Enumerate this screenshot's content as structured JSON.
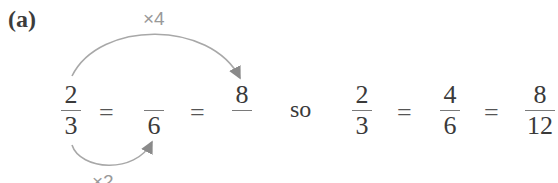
{
  "label": "(a)",
  "arrows": {
    "top": {
      "operator": "×4",
      "from": "numerator 2",
      "to": "numerator 8"
    },
    "bottom": {
      "operator": "×2",
      "from": "denominator 3",
      "to": "denominator 6"
    },
    "color": "#9a9a9a"
  },
  "left_equation": {
    "fractions": [
      {
        "numerator": "2",
        "denominator": "3"
      },
      {
        "numerator": "",
        "denominator": "6"
      },
      {
        "numerator": "8",
        "denominator": ""
      }
    ],
    "equals": "="
  },
  "connector": "so",
  "right_equation": {
    "fractions": [
      {
        "numerator": "2",
        "denominator": "3"
      },
      {
        "numerator": "4",
        "denominator": "6"
      },
      {
        "numerator": "8",
        "denominator": "12"
      }
    ],
    "equals": "="
  }
}
